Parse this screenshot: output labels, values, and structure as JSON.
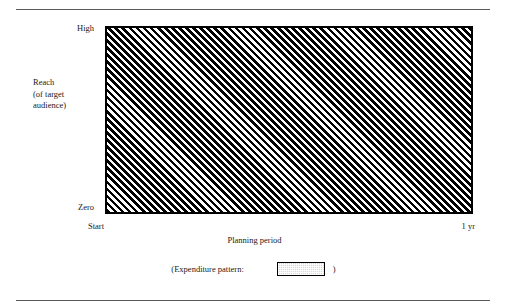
{
  "chart_data": {
    "type": "area",
    "title": "",
    "xlabel": "Planning period",
    "ylabel": "Reach (of target audience)",
    "ylabel_lines": [
      "Reach",
      "(of target",
      "audience)"
    ],
    "x_tick_labels": [
      "Start",
      "1 yr"
    ],
    "y_tick_labels": [
      "Zero",
      "High"
    ],
    "ylim_labels": [
      "Zero",
      "High"
    ],
    "grid": false,
    "legend_position": "below",
    "series": [
      {
        "name": "Expenditure pattern",
        "fill": "diagonal-hatch",
        "description": "Continuous full-height expenditure across the entire planning period",
        "x": [
          "Start",
          "1 yr"
        ],
        "values": [
          100,
          100
        ]
      }
    ],
    "annotations": []
  },
  "axis": {
    "y_top_label": "High",
    "y_bottom_label": "Zero",
    "y_title_line1": "Reach",
    "y_title_line2": "(of target",
    "y_title_line3": "audience)",
    "x_start_label": "Start",
    "x_end_label": "1 yr",
    "x_title": "Planning period"
  },
  "legend": {
    "prefix_text": "(Expenditure pattern:",
    "suffix_text": ")",
    "swatch_name": "expenditure-pattern-swatch"
  },
  "colors": {
    "hatch": "#000000",
    "plot_border": "#000000",
    "background": "#ffffff",
    "rule": "#5a5a5a",
    "swatch_fill": "#d8d8d8",
    "text": "#1a1a1a"
  }
}
